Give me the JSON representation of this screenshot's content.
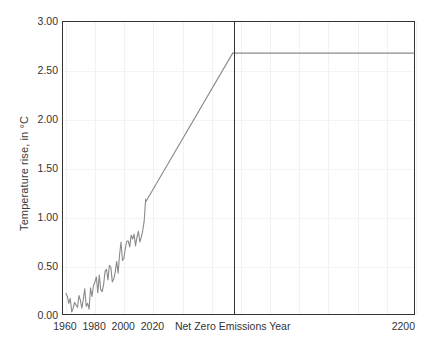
{
  "chart_data": {
    "type": "line",
    "title": "",
    "xlabel": "",
    "ylabel": "Temperature rise, in °C",
    "ylim": [
      0.0,
      3.0
    ],
    "yticks": [
      "0.00",
      "0.50",
      "1.00",
      "1.50",
      "2.00",
      "2.50",
      "3.00"
    ],
    "ytick_values": [
      0.0,
      0.5,
      1.0,
      1.5,
      2.0,
      2.5,
      3.0
    ],
    "xticks": [
      "1960",
      "1980",
      "2000",
      "2020",
      "Net Zero Emissions Year",
      "2200"
    ],
    "xtick_values": [
      1960,
      1980,
      2000,
      2020,
      2075,
      2200
    ],
    "xlim": [
      1958,
      2200
    ],
    "grid": "both",
    "legend": "none",
    "annotations": [
      {
        "name": "net-zero-emissions-year-marker",
        "label": "Net Zero Emissions Year",
        "x": 2075,
        "style": "vertical-line"
      }
    ],
    "series": [
      {
        "name": "historical-observed-temperature",
        "color": "#8a8a8a",
        "x": [
          1960,
          1961,
          1962,
          1963,
          1964,
          1965,
          1966,
          1967,
          1968,
          1969,
          1970,
          1971,
          1972,
          1973,
          1974,
          1975,
          1976,
          1977,
          1978,
          1979,
          1980,
          1981,
          1982,
          1983,
          1984,
          1985,
          1986,
          1987,
          1988,
          1989,
          1990,
          1991,
          1992,
          1993,
          1994,
          1995,
          1996,
          1997,
          1998,
          1999,
          2000,
          2001,
          2002,
          2003,
          2004,
          2005,
          2006,
          2007,
          2008,
          2009,
          2010,
          2011,
          2012,
          2013,
          2014,
          2015
        ],
        "values": [
          0.21,
          0.18,
          0.11,
          0.16,
          0.02,
          0.06,
          0.12,
          0.09,
          0.07,
          0.19,
          0.14,
          0.06,
          0.15,
          0.26,
          0.08,
          0.11,
          0.05,
          0.27,
          0.18,
          0.29,
          0.33,
          0.38,
          0.22,
          0.4,
          0.25,
          0.23,
          0.3,
          0.44,
          0.46,
          0.35,
          0.5,
          0.48,
          0.33,
          0.36,
          0.43,
          0.54,
          0.42,
          0.61,
          0.74,
          0.55,
          0.57,
          0.68,
          0.75,
          0.75,
          0.69,
          0.81,
          0.77,
          0.82,
          0.7,
          0.79,
          0.85,
          0.74,
          0.79,
          0.86,
          0.96,
          1.18
        ]
      },
      {
        "name": "projected-warming-to-net-zero",
        "color": "#8a8a8a",
        "x": [
          2015,
          2075
        ],
        "values": [
          1.15,
          2.68
        ]
      },
      {
        "name": "post-net-zero-plateau",
        "color": "#8a8a8a",
        "x": [
          2075,
          2200
        ],
        "values": [
          2.68,
          2.68
        ]
      }
    ]
  },
  "colors": {
    "series_line": "#8a8a8a",
    "axis_frame": "#333333",
    "gridline": "#f2f2f2",
    "tick_text": "#333333",
    "background": "#ffffff"
  }
}
